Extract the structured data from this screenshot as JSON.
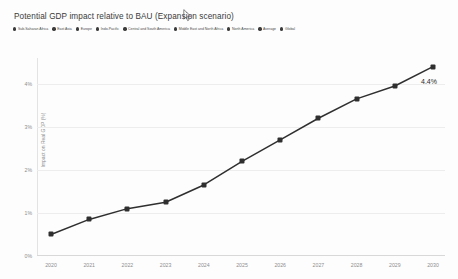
{
  "chart": {
    "title": "Potential GDP impact relative to BAU (Expansion scenario)",
    "end_label": "4.4%"
  },
  "legend": {
    "items": [
      {
        "label": "Sub-Saharan Africa",
        "color": "#3b3b3b"
      },
      {
        "label": "East Asia",
        "color": "#3b3b3b"
      },
      {
        "label": "Europe",
        "color": "#3b3b3b"
      },
      {
        "label": "Indo-Pacific",
        "color": "#3b3b3b"
      },
      {
        "label": "Central and South America",
        "color": "#3b3b3b"
      },
      {
        "label": "Middle East and North Africa",
        "color": "#3b3b3b"
      },
      {
        "label": "North America",
        "color": "#3b3b3b"
      },
      {
        "label": "Average",
        "color": "#3b3b3b"
      },
      {
        "label": "Global",
        "color": "#3b3b3b"
      }
    ]
  },
  "chart_data": {
    "type": "line",
    "title": "Potential GDP impact relative to BAU (Expansion scenario)",
    "xlabel": "",
    "ylabel": "Impact on Real GDP (%)",
    "categories": [
      "2020",
      "2021",
      "2022",
      "2023",
      "2024",
      "2025",
      "2026",
      "2027",
      "2028",
      "2029",
      "2030"
    ],
    "series": [
      {
        "name": "Global",
        "color": "#2f2f2f",
        "values": [
          0.5,
          0.85,
          1.1,
          1.25,
          1.65,
          2.2,
          2.7,
          3.2,
          3.65,
          3.95,
          4.4
        ]
      }
    ],
    "ylim": [
      0,
      4.6
    ],
    "yticks": [
      0,
      1,
      2,
      3,
      4
    ],
    "ytick_labels": [
      "0%",
      "1%",
      "2%",
      "3%",
      "4%"
    ],
    "grid": true,
    "legend_position": "top",
    "annotations": [
      {
        "text": "4.4%",
        "x": "2030",
        "y": 4.4
      }
    ]
  }
}
